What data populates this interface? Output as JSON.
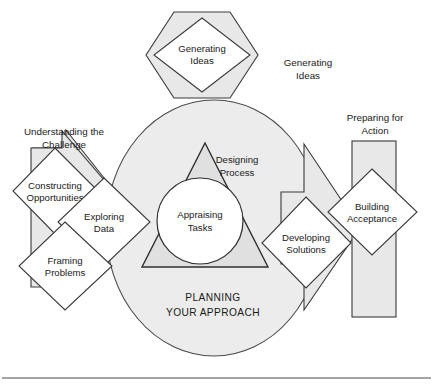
{
  "figure": {
    "title": "PLANNING YOUR APPROACH",
    "bottom_rule": true,
    "colors": {
      "shape_fill": "#e8e8e8",
      "shape_white": "#ffffff",
      "circle_fill": "#ececec",
      "triangle_fill": "#e0e0e0",
      "stroke": "#3a3a3a",
      "text": "#1a1a1a"
    }
  },
  "components": {
    "top_hexagon": {
      "diamond_label_line1": "Generating",
      "diamond_label_line2": "Ideas"
    },
    "left_arrow": {
      "diamonds": [
        {
          "line1": "Constructing",
          "line2": "Opportunities"
        },
        {
          "line1": "Exploring",
          "line2": "Data"
        },
        {
          "line1": "Framing",
          "line2": "Problems"
        }
      ]
    },
    "right_arrow": {
      "diamonds": [
        {
          "line1": "Developing",
          "line2": "Solutions"
        }
      ]
    },
    "right_rectangle": {
      "diamonds": [
        {
          "line1": "Building",
          "line2": "Acceptance"
        }
      ]
    },
    "center": {
      "triangle_label_line1": "Designing",
      "triangle_label_line2": "Process",
      "circle_label_line1": "Appraising",
      "circle_label_line2": "Tasks",
      "caption_line1": "PLANNING",
      "caption_line2": "YOUR APPROACH"
    }
  },
  "outer_labels": {
    "top_right": {
      "line1": "Generating",
      "line2": "Ideas"
    },
    "left": {
      "line1": "Understanding the",
      "line2": "Challenge"
    },
    "right": {
      "line1": "Preparing for",
      "line2": "Action"
    }
  }
}
